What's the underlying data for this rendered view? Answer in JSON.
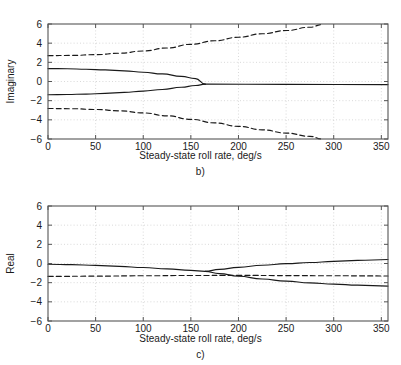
{
  "figure": {
    "background": "#ffffff",
    "line_color": "#1a1a1a",
    "grid_color": "#c8c8c8",
    "axis_color": "#555555"
  },
  "panels": [
    {
      "id": "b",
      "caption": "b)",
      "xlabel": "Steady-state roll rate, deg/s",
      "ylabel": "Imaginary"
    },
    {
      "id": "c",
      "caption": "c)",
      "xlabel": "Steady-state roll rate, deg/s",
      "ylabel": "Real"
    }
  ],
  "chart_data": [
    {
      "type": "line",
      "panel": "b",
      "title": "",
      "xlabel": "Steady-state roll rate, deg/s",
      "ylabel": "Imaginary",
      "xlim": [
        0,
        357
      ],
      "ylim": [
        -6,
        6
      ],
      "xticks": [
        0,
        50,
        100,
        150,
        200,
        250,
        300,
        350
      ],
      "yticks": [
        -6,
        -4,
        -2,
        0,
        2,
        4,
        6
      ],
      "grid": true,
      "legend": "none",
      "series": [
        {
          "name": "dutch-roll-upper",
          "style": "dashed",
          "x": [
            0,
            25,
            50,
            75,
            100,
            125,
            150,
            175,
            200,
            225,
            250,
            275,
            288
          ],
          "y": [
            2.7,
            2.72,
            2.8,
            2.95,
            3.18,
            3.5,
            3.88,
            4.25,
            4.62,
            4.98,
            5.32,
            5.66,
            5.95
          ]
        },
        {
          "name": "dutch-roll-lower",
          "style": "dashed",
          "x": [
            0,
            25,
            50,
            75,
            100,
            125,
            150,
            175,
            200,
            225,
            250,
            275,
            288
          ],
          "y": [
            -2.82,
            -2.84,
            -2.92,
            -3.06,
            -3.28,
            -3.58,
            -3.95,
            -4.32,
            -4.68,
            -5.04,
            -5.38,
            -5.72,
            -6.0
          ]
        },
        {
          "name": "roll-spiral-upper",
          "style": "solid",
          "x": [
            0,
            20,
            40,
            60,
            80,
            100,
            120,
            140,
            155,
            165
          ],
          "y": [
            1.35,
            1.33,
            1.28,
            1.21,
            1.11,
            0.97,
            0.79,
            0.53,
            0.3,
            -0.28
          ]
        },
        {
          "name": "roll-spiral-lower",
          "style": "solid",
          "x": [
            0,
            20,
            40,
            60,
            80,
            100,
            120,
            140,
            155,
            165
          ],
          "y": [
            -1.38,
            -1.36,
            -1.31,
            -1.24,
            -1.14,
            -1.0,
            -0.83,
            -0.6,
            -0.42,
            -0.28
          ]
        },
        {
          "name": "real-pair-zero-imag",
          "style": "solid",
          "x": [
            165,
            250,
            357
          ],
          "y": [
            -0.28,
            -0.3,
            -0.32
          ]
        }
      ]
    },
    {
      "type": "line",
      "panel": "c",
      "title": "",
      "xlabel": "Steady-state roll rate, deg/s",
      "ylabel": "Real",
      "xlim": [
        0,
        357
      ],
      "ylim": [
        -6,
        6
      ],
      "xticks": [
        0,
        50,
        100,
        150,
        200,
        250,
        300,
        350
      ],
      "yticks": [
        -6,
        -4,
        -2,
        0,
        2,
        4,
        6
      ],
      "grid": true,
      "legend": "none",
      "series": [
        {
          "name": "dutch-roll-real",
          "style": "dashed",
          "x": [
            0,
            50,
            100,
            150,
            200,
            250,
            300,
            357
          ],
          "y": [
            -1.35,
            -1.32,
            -1.28,
            -1.25,
            -1.24,
            -1.26,
            -1.28,
            -1.3
          ]
        },
        {
          "name": "roll-spiral-real-common",
          "style": "solid",
          "x": [
            0,
            25,
            50,
            75,
            100,
            125,
            150,
            165
          ],
          "y": [
            -0.08,
            -0.12,
            -0.2,
            -0.3,
            -0.42,
            -0.56,
            -0.72,
            -0.82
          ]
        },
        {
          "name": "branch-upper-real",
          "style": "solid",
          "x": [
            165,
            180,
            200,
            225,
            250,
            275,
            300,
            325,
            357
          ],
          "y": [
            -0.82,
            -0.62,
            -0.4,
            -0.18,
            -0.02,
            0.1,
            0.22,
            0.32,
            0.42
          ]
        },
        {
          "name": "branch-lower-real",
          "style": "solid",
          "x": [
            165,
            180,
            200,
            225,
            250,
            275,
            300,
            325,
            357
          ],
          "y": [
            -0.82,
            -1.05,
            -1.33,
            -1.62,
            -1.84,
            -2.02,
            -2.15,
            -2.26,
            -2.36
          ]
        }
      ]
    }
  ]
}
